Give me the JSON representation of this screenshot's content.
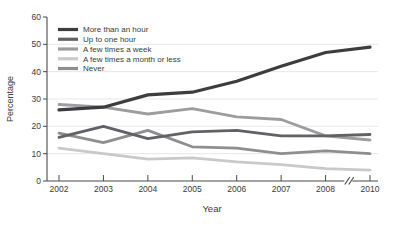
{
  "chart_data": {
    "type": "line",
    "title": "",
    "xlabel": "Year",
    "ylabel": "Percentage",
    "x_categories": [
      "2002",
      "2003",
      "2004",
      "2005",
      "2006",
      "2007",
      "2008",
      "2010"
    ],
    "axis_break_after": "2008",
    "ylim": [
      0,
      60
    ],
    "yticks": [
      0,
      10,
      20,
      30,
      40,
      50,
      60
    ],
    "gridlines": [
      10,
      20,
      30,
      40,
      50
    ],
    "grid_on": true,
    "legend_position": "top-left-inside",
    "colors": {
      "axis": "#4a4a4a",
      "grid": "#e7e7e7",
      "text": "#3a3a3a"
    },
    "series": [
      {
        "name": "More than an hour",
        "color": "#3d3d40",
        "line_width": 3.2,
        "values": [
          26,
          27,
          31.5,
          32.5,
          36.5,
          42,
          47,
          49
        ]
      },
      {
        "name": "Up to one hour",
        "color": "#626266",
        "line_width": 2.8,
        "values": [
          16,
          20,
          15.5,
          18,
          18.5,
          16.5,
          16.5,
          17
        ]
      },
      {
        "name": "A few times a week",
        "color": "#9d9d9f",
        "line_width": 2.8,
        "values": [
          28,
          27,
          24.5,
          26.5,
          23.5,
          22.5,
          16.5,
          15
        ]
      },
      {
        "name": "A few times a month or less",
        "color": "#c9c9cb",
        "line_width": 2.8,
        "values": [
          12,
          10,
          8,
          8.5,
          7,
          6,
          4.5,
          4
        ]
      },
      {
        "name": "Never",
        "color": "#8e8e91",
        "line_width": 2.8,
        "values": [
          17.5,
          14,
          18.5,
          12.5,
          12,
          10,
          11,
          10
        ]
      }
    ]
  }
}
